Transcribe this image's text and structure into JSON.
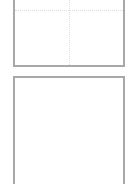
{
  "panels": [
    {
      "id": "top",
      "label": "",
      "border_color": "#a8a8a8",
      "guides": {
        "horizontal": true,
        "vertical": true,
        "color": "#dcdcdc"
      }
    },
    {
      "id": "bottom",
      "label": "",
      "border_color": "#a8a8a8",
      "guides": {
        "horizontal": false,
        "vertical": false
      }
    }
  ],
  "background": "#ffffff"
}
